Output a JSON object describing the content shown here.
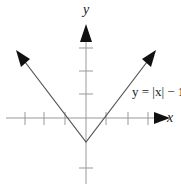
{
  "labels": {
    "y_axis": "y",
    "x_axis": "x",
    "equation": "y = |x| − 1"
  },
  "graph": {
    "function": "y = |x| - 1",
    "vertex": [
      0,
      -1
    ],
    "x_intercepts": [
      -1,
      1
    ],
    "x_ticks": [
      -3,
      -2,
      -1,
      1,
      2,
      3
    ],
    "y_ticks": [
      -2,
      1,
      2,
      3
    ],
    "line_color": "#555555",
    "axis_color": "#888888"
  }
}
